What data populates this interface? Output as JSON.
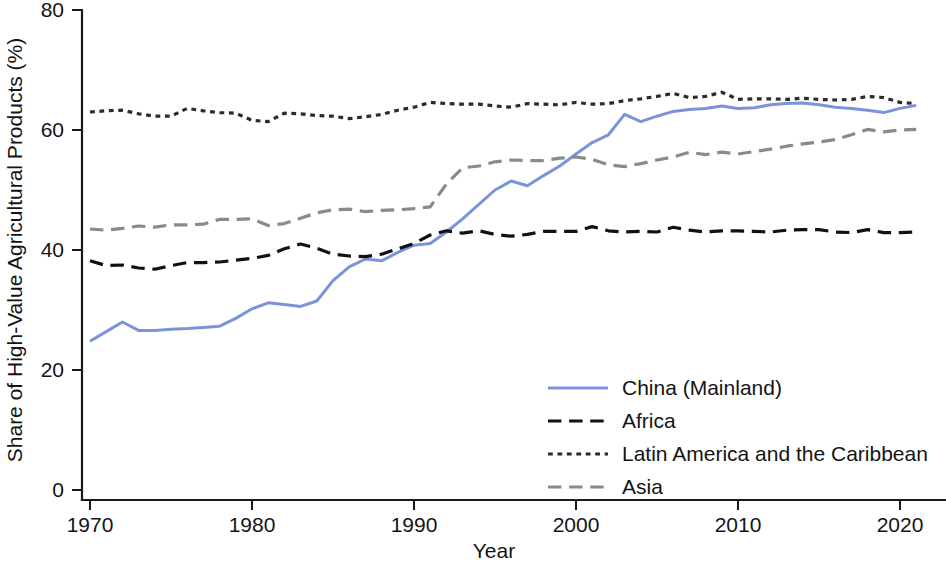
{
  "chart_data": {
    "type": "line",
    "title": "",
    "xlabel": "Year",
    "ylabel": "Share of High-Value Agricultural Products (%)",
    "xlim": [
      1969,
      2022
    ],
    "ylim": [
      0,
      80
    ],
    "xticks": [
      1970,
      1980,
      1990,
      2000,
      2010,
      2020
    ],
    "yticks": [
      0,
      20,
      40,
      60,
      80
    ],
    "grid": false,
    "legend_position": "center-right-lower",
    "x": [
      1970,
      1971,
      1972,
      1973,
      1974,
      1975,
      1976,
      1977,
      1978,
      1979,
      1980,
      1981,
      1982,
      1983,
      1984,
      1985,
      1986,
      1987,
      1988,
      1989,
      1990,
      1991,
      1992,
      1993,
      1994,
      1995,
      1996,
      1997,
      1998,
      1999,
      2000,
      2001,
      2002,
      2003,
      2004,
      2005,
      2006,
      2007,
      2008,
      2009,
      2010,
      2011,
      2012,
      2013,
      2014,
      2015,
      2016,
      2017,
      2018,
      2019,
      2020,
      2021
    ],
    "series": [
      {
        "name": "China (Mainland)",
        "color": "#7B93DB",
        "style": "solid",
        "width": 3.0,
        "values": [
          24.8,
          26.4,
          28.0,
          26.6,
          26.6,
          26.8,
          26.9,
          27.1,
          27.3,
          28.6,
          30.2,
          31.2,
          30.9,
          30.6,
          31.5,
          34.9,
          37.2,
          38.5,
          38.2,
          39.6,
          40.8,
          41.1,
          43.0,
          45.2,
          47.6,
          50.0,
          51.5,
          50.7,
          52.4,
          54.0,
          56.0,
          57.9,
          59.2,
          62.6,
          61.4,
          62.3,
          63.1,
          63.4,
          63.6,
          64.0,
          63.6,
          63.7,
          64.2,
          64.4,
          64.5,
          64.2,
          63.8,
          63.6,
          63.3,
          62.9,
          63.6,
          64.1
        ]
      },
      {
        "name": "Africa",
        "color": "#111111",
        "style": "dashed",
        "width": 3.2,
        "values": [
          38.2,
          37.4,
          37.5,
          37.0,
          36.8,
          37.4,
          37.9,
          37.9,
          38.0,
          38.3,
          38.6,
          39.1,
          40.2,
          41.0,
          40.3,
          39.3,
          39.0,
          38.9,
          39.3,
          40.2,
          41.1,
          42.5,
          43.2,
          42.8,
          43.2,
          42.6,
          42.3,
          42.6,
          43.1,
          43.1,
          43.1,
          43.9,
          43.2,
          43.0,
          43.1,
          43.0,
          43.8,
          43.3,
          43.0,
          43.2,
          43.2,
          43.1,
          43.0,
          43.3,
          43.4,
          43.4,
          43.0,
          42.9,
          43.4,
          42.9,
          42.9,
          43.0
        ]
      },
      {
        "name": "Latin America and the Caribbean",
        "color": "#2b2b2b",
        "style": "dotted",
        "width": 3.2,
        "values": [
          63.0,
          63.2,
          63.3,
          62.7,
          62.3,
          62.3,
          63.6,
          63.2,
          62.9,
          62.8,
          61.6,
          61.4,
          62.8,
          62.7,
          62.4,
          62.3,
          61.9,
          62.2,
          62.6,
          63.3,
          63.8,
          64.6,
          64.4,
          64.3,
          64.3,
          64.0,
          63.8,
          64.4,
          64.3,
          64.2,
          64.6,
          64.3,
          64.4,
          64.9,
          65.2,
          65.6,
          66.1,
          65.4,
          65.6,
          66.3,
          65.1,
          65.2,
          65.2,
          65.1,
          65.3,
          65.1,
          65.0,
          65.1,
          65.6,
          65.4,
          64.6,
          64.4
        ]
      },
      {
        "name": "Asia",
        "color": "#8a8a8a",
        "style": "dashed",
        "width": 3.2,
        "values": [
          43.5,
          43.3,
          43.6,
          44.0,
          43.8,
          44.2,
          44.2,
          44.3,
          45.1,
          45.1,
          45.2,
          44.1,
          44.4,
          45.3,
          46.2,
          46.7,
          46.8,
          46.4,
          46.6,
          46.7,
          46.9,
          47.2,
          51.0,
          53.7,
          54.0,
          54.7,
          55.0,
          54.9,
          54.9,
          55.3,
          55.5,
          55.1,
          54.2,
          53.9,
          54.4,
          55.0,
          55.5,
          56.3,
          55.9,
          56.3,
          56.0,
          56.4,
          56.8,
          57.3,
          57.7,
          58.0,
          58.4,
          59.2,
          60.1,
          59.7,
          60.0,
          60.1
        ]
      }
    ]
  },
  "axes": {
    "y_title": "Share of High-Value Agricultural Products (%)",
    "x_title": "Year",
    "y_tick_labels": [
      "80",
      "60",
      "40",
      "20",
      "0"
    ],
    "x_tick_labels": [
      "1970",
      "1980",
      "1990",
      "2000",
      "2010",
      "2020"
    ]
  },
  "legend": {
    "entries": [
      {
        "label": "China (Mainland)"
      },
      {
        "label": "Africa"
      },
      {
        "label": "Latin America and the Caribbean"
      },
      {
        "label": "Asia"
      }
    ]
  }
}
